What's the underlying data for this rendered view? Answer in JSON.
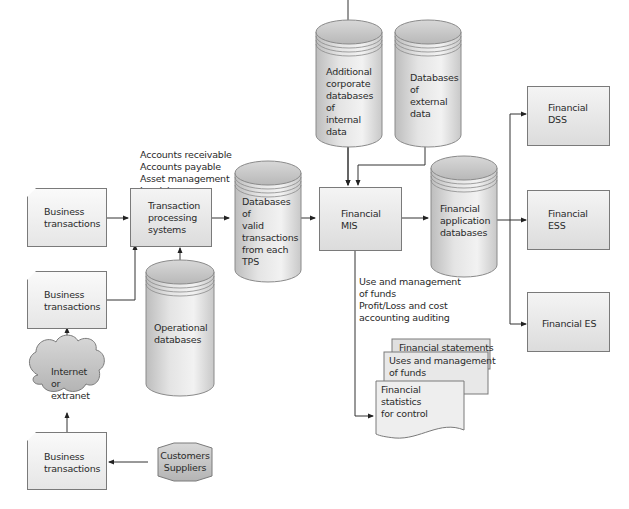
{
  "diagram": {
    "tps_functions": [
      "Accounts receivable",
      "Accounts payable",
      "Asset management",
      "Invoicing",
      "General ledger"
    ],
    "business_transactions_1": [
      "Business",
      "transactions"
    ],
    "business_transactions_2": [
      "Business",
      "transactions"
    ],
    "business_transactions_3": [
      "Business",
      "transactions"
    ],
    "internet": [
      "Internet",
      "or",
      "extranet"
    ],
    "customers_suppliers": [
      "Customers",
      "Suppliers"
    ],
    "tps": [
      "Transaction",
      "processing",
      "systems"
    ],
    "operational_db": [
      "Operational",
      "databases"
    ],
    "valid_tx_db": [
      "Databases",
      "of",
      "valid",
      "transactions",
      "from each",
      "TPS"
    ],
    "internal_db": [
      "Additional",
      "corporate",
      "databases",
      "of",
      "internal",
      "data"
    ],
    "external_db": [
      "Databases",
      "of",
      "external",
      "data"
    ],
    "financial_mis": [
      "Financial",
      "MIS"
    ],
    "fin_app_db": [
      "Financial",
      "application",
      "databases"
    ],
    "financial_dss": [
      "Financial",
      "DSS"
    ],
    "financial_ess": [
      "Financial",
      "ESS"
    ],
    "financial_es": [
      "Financial ES"
    ],
    "mis_outputs": [
      "Use and management",
      "of funds",
      "Profit/Loss and cost",
      "accounting auditing"
    ],
    "reports": {
      "report_1": [
        "Financial statements"
      ],
      "report_2": [
        "Uses and management",
        "of funds"
      ],
      "report_3": [
        "Financial",
        "statistics",
        "for control"
      ]
    }
  },
  "colors": {
    "line": "#333333",
    "box_border": "#7a7a7a",
    "box_fill_top": "#f4f4f4",
    "box_fill_bottom": "#dcdcdc",
    "cylinder_fill": "#cfcfcf",
    "cloud_fill": "#c8c8c8"
  }
}
